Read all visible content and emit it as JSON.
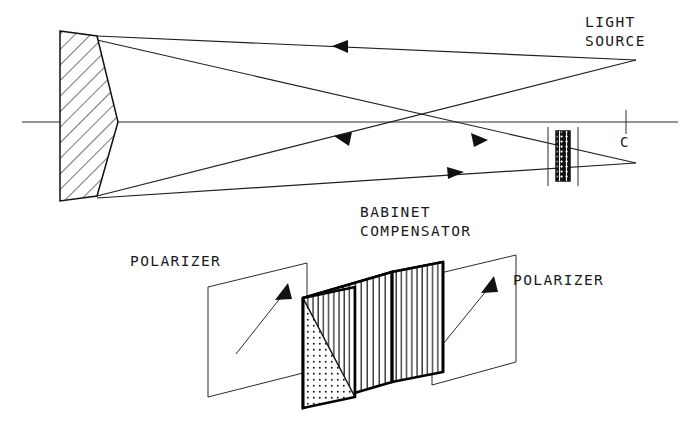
{
  "figure": {
    "title_labels": {
      "light_source": "LIGHT\nSOURCE",
      "light_source_line1": "LIGHT",
      "light_source_line2": "SOURCE",
      "babinet_line1": "BABINET",
      "babinet_line2": "COMPENSATOR",
      "polarizer_left": "POLARIZER",
      "polarizer_right": "POLARIZER",
      "axis_point": "C"
    },
    "colors": {
      "ink": "#111111",
      "ray": "#1f1f1f",
      "hatch": "#2b2b2b",
      "background": "#ffffff",
      "stipple": "#1a1a1a"
    },
    "upper_diagram": {
      "optical_axis": {
        "x1": 22,
        "y1": 122,
        "x2": 678,
        "y2": 122
      },
      "axis_tick": {
        "x": 626,
        "y_top": 110,
        "y_bottom": 134
      },
      "mirror": {
        "kind": "concave-mirror-hatched",
        "left_x": 60,
        "right_x_top": 97,
        "right_x_mid": 118,
        "right_x_bottom": 97,
        "top_y": 31,
        "bottom_y": 201,
        "hatch_spacing": 11,
        "hatch_angle_deg": 45
      },
      "source_point": {
        "x": 636,
        "y": 60
      },
      "focus_point": {
        "x": 636,
        "y": 163
      },
      "crossover_point": {
        "x": 426,
        "y": 122
      },
      "compensator_small": {
        "x": 556,
        "y_top": 131,
        "width": 14,
        "height": 50,
        "guide_line_left_x": 548,
        "guide_line_right_x": 578,
        "guide_top_y": 127,
        "guide_bottom_y": 186
      },
      "rays": [
        {
          "name": "source-to-mirror-top",
          "from": [
            636,
            60
          ],
          "to": [
            97,
            36
          ],
          "arrow_at": 0.38,
          "arrow_dir": "left"
        },
        {
          "name": "mirror-top-to-focus",
          "from": [
            97,
            40
          ],
          "to": [
            636,
            163
          ],
          "arrow_at": 0.81,
          "arrow_dir": "right"
        },
        {
          "name": "source-to-mirror-bottom",
          "from": [
            636,
            60
          ],
          "to": [
            97,
            196
          ],
          "arrow_at": 0.56,
          "arrow_dir": "left"
        },
        {
          "name": "mirror-bottom-to-focus",
          "from": [
            97,
            198
          ],
          "to": [
            636,
            163
          ],
          "arrow_at": 0.7,
          "arrow_dir": "right"
        }
      ]
    },
    "lower_diagram": {
      "block": {
        "name": "babinet-compensator-block",
        "front_face": {
          "points": "303,298 392,272 392,382 303,408",
          "pattern": "vertical-lines"
        },
        "top_face": {
          "points": "303,298 392,272 443,262 355,287",
          "pattern": "stipple-dots"
        },
        "right_face": {
          "points": "392,272 443,262 443,372 392,382",
          "pattern": "vertical-lines"
        },
        "left_face": {
          "points": "303,298 355,287 355,397 303,408",
          "pattern": "split-diagonal"
        }
      },
      "polarizer_left": {
        "plane_points": "208,287 307,263 307,372 208,397",
        "arrow": {
          "from": [
            236,
            354
          ],
          "to": [
            288,
            288
          ]
        }
      },
      "polarizer_right": {
        "plane_points": "432,275 516,255 516,362 432,385",
        "arrow": {
          "from": [
            443,
            344
          ],
          "to": [
            494,
            280
          ]
        }
      }
    },
    "text_positions": {
      "light_source_x": 585,
      "light_source_y1": 27,
      "light_source_y2": 46,
      "babinet_x": 360,
      "babinet_y1": 217,
      "babinet_y2": 235,
      "polarizer_left_x": 130,
      "polarizer_left_y": 265,
      "polarizer_right_x": 513,
      "polarizer_right_y": 284,
      "axis_point_x": 620,
      "axis_point_y": 146
    }
  }
}
